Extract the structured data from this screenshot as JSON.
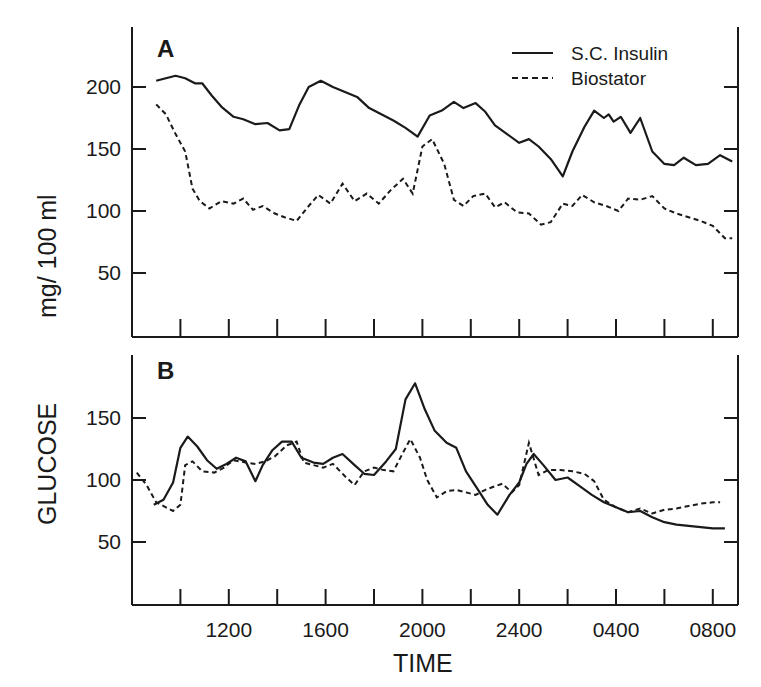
{
  "figure": {
    "y_axis_title_left": "GLUCOSE",
    "y_axis_title_right": "mg/ 100 ml",
    "x_axis_title": "TIME",
    "legend": [
      {
        "label": "S.C. Insulin",
        "style": "solid"
      },
      {
        "label": "Biostator",
        "style": "dashed"
      }
    ],
    "x_tick_labels": [
      "1200",
      "1600",
      "2000",
      "2400",
      "0400",
      "0800"
    ],
    "panels": [
      {
        "label": "A",
        "y_tick_labels": [
          "200",
          "150",
          "100",
          "50"
        ]
      },
      {
        "label": "B",
        "y_tick_labels": [
          "150",
          "100",
          "50"
        ]
      }
    ]
  },
  "chart_data": [
    {
      "type": "line",
      "title": "A",
      "xlabel": "TIME",
      "ylabel": "GLUCOSE mg/100 ml",
      "x_unit": "hours after 0800 (day 1)",
      "x_ticks": [
        2,
        4,
        6,
        8,
        10,
        12,
        14,
        16,
        18,
        20,
        22,
        24
      ],
      "x_tick_labels": {
        "4": "1200",
        "8": "1600",
        "12": "2000",
        "16": "2400",
        "20": "0400",
        "24": "0800"
      },
      "xlim": [
        0,
        25
      ],
      "ylim": [
        0,
        245
      ],
      "y_ticks": [
        50,
        100,
        150,
        200
      ],
      "grid": false,
      "legend_position": "upper right",
      "series": [
        {
          "name": "S.C. Insulin",
          "style": "solid",
          "x": [
            1.0,
            1.4,
            1.8,
            2.2,
            2.6,
            2.9,
            3.3,
            3.7,
            4.2,
            4.6,
            5.1,
            5.6,
            6.1,
            6.5,
            6.9,
            7.3,
            7.8,
            8.3,
            8.8,
            9.3,
            9.8,
            10.3,
            10.8,
            11.3,
            11.8,
            12.3,
            12.8,
            13.3,
            13.7,
            14.2,
            14.6,
            15.0,
            15.5,
            16.0,
            16.4,
            16.8,
            17.3,
            17.8,
            18.2,
            18.7,
            19.1,
            19.5,
            19.7,
            19.9,
            20.2,
            20.6,
            21.0,
            21.5,
            22.0,
            22.4,
            22.8,
            23.3,
            23.8,
            24.3,
            24.8
          ],
          "values": [
            205,
            207,
            209,
            207,
            203,
            203,
            193,
            184,
            176,
            174,
            170,
            171,
            165,
            166,
            185,
            200,
            205,
            200,
            196,
            192,
            183,
            178,
            173,
            167,
            160,
            177,
            181,
            188,
            183,
            187,
            180,
            169,
            162,
            155,
            158,
            152,
            142,
            128,
            148,
            168,
            181,
            175,
            178,
            172,
            176,
            163,
            175,
            148,
            138,
            137,
            143,
            137,
            138,
            145,
            140
          ]
        },
        {
          "name": "Biostator",
          "style": "dashed",
          "x": [
            1.0,
            1.4,
            1.8,
            2.2,
            2.5,
            2.8,
            3.2,
            3.7,
            4.2,
            4.6,
            5.0,
            5.4,
            5.9,
            6.3,
            6.8,
            7.3,
            7.7,
            8.2,
            8.7,
            9.2,
            9.7,
            10.2,
            10.7,
            11.2,
            11.6,
            12.0,
            12.4,
            12.9,
            13.3,
            13.7,
            14.1,
            14.6,
            15.0,
            15.4,
            15.9,
            16.4,
            16.9,
            17.3,
            17.8,
            18.2,
            18.6,
            19.1,
            19.6,
            20.1,
            20.5,
            21.0,
            21.5,
            22.0,
            22.5,
            23.0,
            23.5,
            24.0,
            24.5,
            24.8
          ],
          "values": [
            186,
            178,
            162,
            148,
            118,
            108,
            102,
            108,
            106,
            110,
            101,
            104,
            98,
            95,
            92,
            104,
            113,
            106,
            122,
            108,
            114,
            106,
            117,
            126,
            114,
            152,
            158,
            138,
            109,
            104,
            112,
            114,
            103,
            107,
            99,
            98,
            89,
            91,
            106,
            104,
            113,
            107,
            104,
            100,
            110,
            109,
            112,
            102,
            98,
            95,
            92,
            88,
            78,
            78
          ]
        }
      ]
    },
    {
      "type": "line",
      "title": "B",
      "xlabel": "TIME",
      "ylabel": "GLUCOSE mg/100 ml",
      "x_unit": "hours after 0800 (day 1)",
      "x_ticks": [
        2,
        4,
        6,
        8,
        10,
        12,
        14,
        16,
        18,
        20,
        22,
        24
      ],
      "x_tick_labels": {
        "4": "1200",
        "8": "1600",
        "12": "2000",
        "16": "2400",
        "20": "0400",
        "24": "0800"
      },
      "xlim": [
        0,
        25
      ],
      "ylim": [
        0,
        200
      ],
      "y_ticks": [
        50,
        100,
        150
      ],
      "grid": false,
      "series": [
        {
          "name": "S.C. Insulin",
          "style": "solid",
          "x": [
            0.9,
            1.3,
            1.7,
            2.0,
            2.3,
            2.7,
            3.1,
            3.5,
            3.9,
            4.3,
            4.7,
            5.1,
            5.4,
            5.8,
            6.2,
            6.6,
            7.0,
            7.5,
            7.9,
            8.3,
            8.7,
            9.2,
            9.6,
            10.0,
            10.5,
            10.9,
            11.3,
            11.7,
            12.1,
            12.5,
            13.0,
            13.4,
            13.8,
            14.3,
            14.7,
            15.1,
            15.6,
            16.0,
            16.3,
            16.6,
            17.0,
            17.5,
            18.0,
            18.5,
            19.0,
            19.5,
            20.0,
            20.5,
            21.0,
            21.5,
            22.0,
            22.5,
            23.0,
            23.5,
            24.0,
            24.5
          ],
          "values": [
            80,
            84,
            98,
            126,
            135,
            127,
            116,
            109,
            113,
            118,
            115,
            99,
            112,
            124,
            131,
            131,
            118,
            114,
            113,
            118,
            121,
            112,
            105,
            104,
            115,
            125,
            165,
            178,
            157,
            140,
            130,
            126,
            107,
            92,
            80,
            72,
            88,
            98,
            113,
            121,
            112,
            100,
            102,
            95,
            88,
            82,
            78,
            74,
            75,
            70,
            66,
            64,
            63,
            62,
            61,
            61
          ]
        },
        {
          "name": "Biostator",
          "style": "dashed",
          "x": [
            0.2,
            0.6,
            1.0,
            1.4,
            1.7,
            2.0,
            2.2,
            2.5,
            2.9,
            3.4,
            3.8,
            4.2,
            4.7,
            5.1,
            5.5,
            5.9,
            6.4,
            6.8,
            7.1,
            7.5,
            7.9,
            8.3,
            8.8,
            9.2,
            9.6,
            10.0,
            10.4,
            10.8,
            11.2,
            11.5,
            11.9,
            12.2,
            12.6,
            13.0,
            13.4,
            13.8,
            14.2,
            14.6,
            15.0,
            15.3,
            15.7,
            16.0,
            16.4,
            16.8,
            17.2,
            17.7,
            18.2,
            18.7,
            19.1,
            19.5,
            20.0,
            20.5,
            21.0,
            21.5,
            22.0,
            22.5,
            23.0,
            23.5,
            24.0,
            24.3
          ],
          "values": [
            106,
            96,
            82,
            78,
            75,
            80,
            112,
            115,
            107,
            106,
            110,
            116,
            114,
            113,
            115,
            119,
            128,
            131,
            114,
            112,
            110,
            113,
            103,
            96,
            107,
            110,
            108,
            107,
            122,
            133,
            118,
            100,
            86,
            91,
            92,
            90,
            88,
            92,
            95,
            97,
            90,
            96,
            130,
            104,
            108,
            108,
            107,
            105,
            99,
            84,
            78,
            74,
            77,
            73,
            76,
            77,
            79,
            81,
            82,
            82
          ]
        }
      ]
    }
  ]
}
